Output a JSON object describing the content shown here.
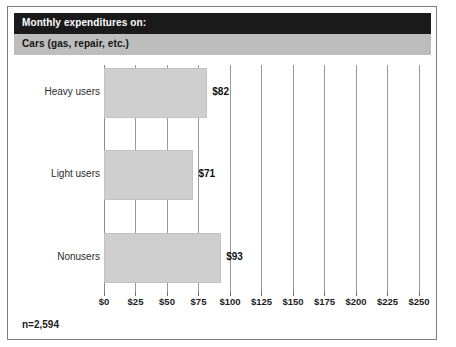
{
  "header": {
    "title": "Monthly expenditures on:",
    "subtitle": "Cars (gas, repair, etc.)"
  },
  "footnote": "n=2,594",
  "colors": {
    "title_bar_bg": "#1a1a1a",
    "title_text": "#ffffff",
    "subtitle_bar_bg": "#bdbdbd",
    "subtitle_text": "#151515",
    "bar_fill": "#cfcfcf",
    "gridline": "#9a9a9a",
    "frame_border": "#7d7d7d"
  },
  "chart_data": {
    "type": "bar",
    "orientation": "horizontal",
    "title": "Monthly expenditures on:",
    "subtitle": "Cars (gas, repair, etc.)",
    "categories": [
      "Heavy users",
      "Light users",
      "Nonusers"
    ],
    "values": [
      82,
      71,
      93
    ],
    "value_labels": [
      "$82",
      "$71",
      "$93"
    ],
    "xlabel": "",
    "ylabel": "",
    "xlim": [
      0,
      250
    ],
    "xticks": [
      0,
      25,
      50,
      75,
      100,
      125,
      150,
      175,
      200,
      225,
      250
    ],
    "xtick_labels": [
      "$0",
      "$25",
      "$50",
      "$75",
      "$100",
      "$125",
      "$150",
      "$175",
      "$200",
      "$225",
      "$250"
    ],
    "grid": true,
    "grid_axis": "x",
    "legend": false,
    "annotations": [
      "n=2,594"
    ]
  }
}
